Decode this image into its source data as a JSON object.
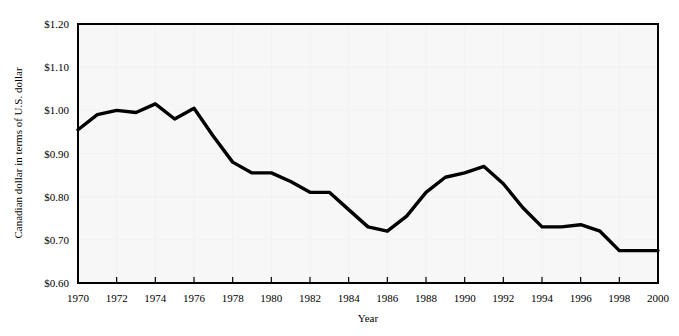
{
  "chart_data": {
    "type": "line",
    "title": "",
    "xlabel": "Year",
    "ylabel": "Canadian dollar in terms of U.S. dollar",
    "xlim": [
      1970,
      2000
    ],
    "ylim": [
      0.6,
      1.2
    ],
    "ytick_step": 0.1,
    "xtick_step": 2,
    "grid": true,
    "legend": null,
    "line_color": "#000000",
    "background_color": "#f7f7f7",
    "gridline_color": "#f2f2f2",
    "ytick_labels": [
      "$1.20",
      "$1.10",
      "$1.00",
      "$0.90",
      "$0.80",
      "$0.70",
      "$0.60"
    ],
    "ytick_values": [
      1.2,
      1.1,
      1.0,
      0.9,
      0.8,
      0.7,
      0.6
    ],
    "xtick_labels": [
      "1970",
      "1972",
      "1974",
      "1976",
      "1978",
      "1980",
      "1982",
      "1984",
      "1986",
      "1988",
      "1990",
      "1992",
      "1994",
      "1996",
      "1998",
      "2000"
    ],
    "xtick_values": [
      1970,
      1972,
      1974,
      1976,
      1978,
      1980,
      1982,
      1984,
      1986,
      1988,
      1990,
      1992,
      1994,
      1996,
      1998,
      2000
    ],
    "x": [
      1970,
      1971,
      1972,
      1973,
      1974,
      1975,
      1976,
      1977,
      1978,
      1979,
      1980,
      1981,
      1982,
      1983,
      1984,
      1985,
      1986,
      1987,
      1988,
      1989,
      1990,
      1991,
      1992,
      1993,
      1994,
      1995,
      1996,
      1997,
      1998,
      1999,
      2000
    ],
    "values": [
      0.955,
      0.99,
      1.0,
      0.995,
      1.015,
      0.98,
      1.005,
      0.94,
      0.88,
      0.855,
      0.855,
      0.835,
      0.81,
      0.81,
      0.77,
      0.73,
      0.72,
      0.755,
      0.81,
      0.845,
      0.855,
      0.87,
      0.83,
      0.775,
      0.73,
      0.73,
      0.735,
      0.72,
      0.675,
      0.675,
      0.675
    ]
  }
}
